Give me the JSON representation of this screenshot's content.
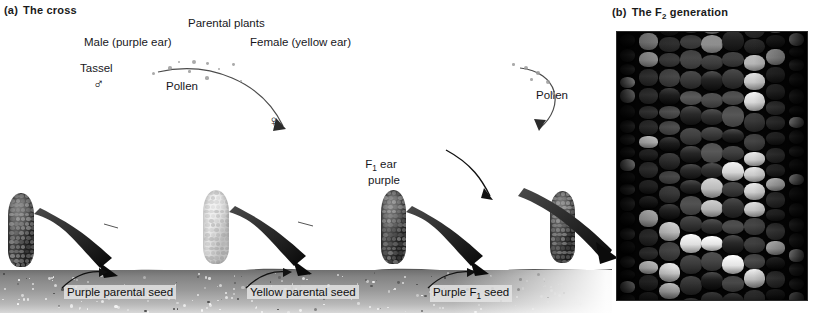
{
  "figure": {
    "panel_a": {
      "label": "(a)",
      "title": "The cross"
    },
    "panel_b": {
      "label": "(b)",
      "title_pre": "The F",
      "title_sub": "2",
      "title_post": " generation"
    }
  },
  "diagram": {
    "parental_plants_label": "Parental plants",
    "male_label": "Male (purple ear)",
    "female_label": "Female (yellow ear)",
    "tassel_label": "Tassel",
    "male_symbol": "♂",
    "female_symbol": "♀",
    "pollen_label_left": "Pollen",
    "pollen_label_right": "Pollen",
    "f1_ear_line1_pre": "F",
    "f1_ear_line1_sub": "1",
    "f1_ear_line1_post": " ear",
    "f1_ear_line2": "purple",
    "seed_labels": [
      {
        "text": "Purple parental seed"
      },
      {
        "text": "Yellow parental seed"
      },
      {
        "text_pre": "Purple F",
        "text_sub": "1",
        "text_post": " seed"
      }
    ],
    "ears": [
      {
        "name": "purple-parental-ear",
        "color": "purple"
      },
      {
        "name": "yellow-parental-ear",
        "color": "yellow"
      },
      {
        "name": "f1-purple-ear",
        "color": "purple"
      },
      {
        "name": "f1-purple-ear-right",
        "color": "purple"
      }
    ],
    "plants": [
      {
        "name": "male-parent-plant"
      },
      {
        "name": "female-parent-plant"
      },
      {
        "name": "f1-plant"
      }
    ]
  },
  "colors": {
    "soil_top": "#6f6f6f",
    "soil_bottom": "#d8d8d8",
    "purple_kernel": "#2a2a2a",
    "yellow_kernel": "#e6e6e6",
    "photo_background": "#050505",
    "text": "#17171c"
  },
  "photo": {
    "description": "F2 generation corn ear close-up",
    "dark_kernel_ratio": 0.72,
    "kernel_columns": 9
  }
}
